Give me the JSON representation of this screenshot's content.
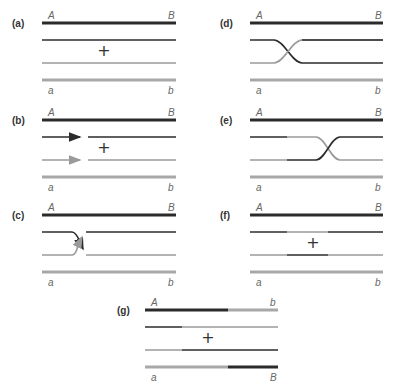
{
  "colors": {
    "dark": "#2b2b2b",
    "light": "#9a9a9a",
    "thick_light": "#a8a8a8"
  },
  "panels": [
    {
      "id": "a",
      "label": "(a)",
      "x0": 42,
      "x1": 176,
      "y": 23,
      "lx": 12,
      "top_left": "A",
      "top_right": "B",
      "bottom_left": "a",
      "bottom_right": "b",
      "plus": "+",
      "plus_x": 104,
      "type": "separate"
    },
    {
      "id": "b",
      "label": "(b)",
      "x0": 42,
      "x1": 176,
      "y": 120,
      "lx": 12,
      "top_left": "A",
      "top_right": "B",
      "bottom_left": "a",
      "bottom_right": "b",
      "plus": "+",
      "plus_x": 104,
      "type": "nicked",
      "break_x": 84
    },
    {
      "id": "c",
      "label": "(c)",
      "x0": 42,
      "x1": 176,
      "y": 215,
      "lx": 12,
      "top_left": "A",
      "top_right": "B",
      "bottom_left": "a",
      "bottom_right": "b",
      "plus": "",
      "type": "invasion",
      "cross_x": 80
    },
    {
      "id": "d",
      "label": "(d)",
      "x0": 250,
      "x1": 383,
      "y": 23,
      "lx": 220,
      "top_left": "A",
      "top_right": "B",
      "bottom_left": "a",
      "bottom_right": "b",
      "plus": "",
      "type": "ligated",
      "cross_x": 288
    },
    {
      "id": "e",
      "label": "(e)",
      "x0": 250,
      "x1": 383,
      "y": 120,
      "lx": 220,
      "top_left": "A",
      "top_right": "B",
      "bottom_left": "a",
      "bottom_right": "b",
      "plus": "",
      "type": "migrated",
      "seg_x": 287,
      "cross_x": 328
    },
    {
      "id": "f",
      "label": "(f)",
      "x0": 250,
      "x1": 383,
      "y": 215,
      "lx": 220,
      "top_left": "A",
      "top_right": "B",
      "bottom_left": "a",
      "bottom_right": "b",
      "plus": "+",
      "plus_x": 313,
      "type": "patch",
      "p0": 287,
      "p1": 328
    },
    {
      "id": "g",
      "label": "(g)",
      "x0": 145,
      "x1": 278,
      "y": 310,
      "lx": 117,
      "top_left": "A",
      "top_right": "b",
      "bottom_left": "a",
      "bottom_right": "B",
      "plus": "+",
      "plus_x": 208,
      "type": "splice",
      "p0": 182,
      "p1": 228
    }
  ]
}
